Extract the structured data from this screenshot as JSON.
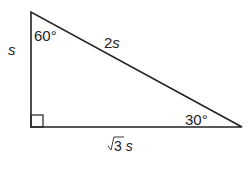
{
  "diagram": {
    "type": "right-triangle-30-60-90",
    "vertices": {
      "top": [
        31,
        12
      ],
      "right_angle": [
        31,
        127
      ],
      "right": [
        242,
        127
      ]
    },
    "stroke_color": "#222222",
    "labels": {
      "left_side_var": "s",
      "hypotenuse_num": "2",
      "hypotenuse_var": "s",
      "base_radical": "3",
      "base_var": "s",
      "top_angle": "60°",
      "right_angle_label": "30°"
    }
  }
}
